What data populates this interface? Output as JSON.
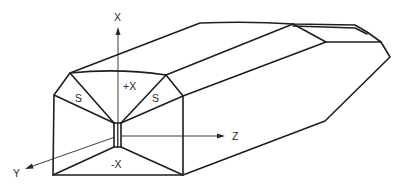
{
  "diagram": {
    "type": "isometric-solid-with-axes",
    "axes": [
      {
        "id": "x",
        "label": "X"
      },
      {
        "id": "y",
        "label": "Y"
      },
      {
        "id": "z",
        "label": "Z"
      }
    ],
    "face_labels": {
      "top": "+X",
      "bottom": "-X",
      "left_bevel": "S",
      "right_bevel": "S"
    },
    "caption": ""
  }
}
